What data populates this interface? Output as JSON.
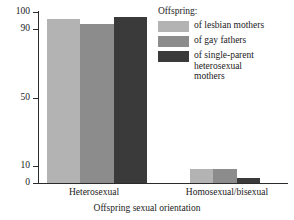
{
  "chart_data": {
    "type": "bar",
    "title": "",
    "xlabel": "Offspring sexual orientation",
    "ylabel": "",
    "categories": [
      "Heterosexual",
      "Homosexual/bisexual"
    ],
    "ylim": [
      0,
      100
    ],
    "yticks": [
      0,
      10,
      50,
      90,
      100
    ],
    "ytick_labels": [
      "0",
      "10",
      "50",
      "90",
      "100"
    ],
    "grid": false,
    "legend_position": "top-right",
    "legend_title": "Offspring:",
    "series": [
      {
        "name": "of lesbian mothers",
        "color": "#b3b3b3",
        "values": [
          96,
          8
        ]
      },
      {
        "name": "of gay fathers",
        "color": "#8c8c8c",
        "values": [
          93,
          8
        ]
      },
      {
        "name": "of single-parent\nheterosexual\nmothers",
        "color": "#3a3a3a",
        "values": [
          97,
          3
        ]
      }
    ]
  },
  "axis": {
    "x_title": "Offspring sexual orientation",
    "tick_100": "100",
    "tick_90": "90",
    "tick_50": "50",
    "tick_10": "10",
    "tick_0": "0",
    "group_1": "Heterosexual",
    "group_2": "Homosexual/bisexual"
  },
  "legend": {
    "title": "Offspring:",
    "item_1": "of lesbian mothers",
    "item_2": "of gay fathers",
    "item_3": "of single-parent\nheterosexual\nmothers"
  }
}
